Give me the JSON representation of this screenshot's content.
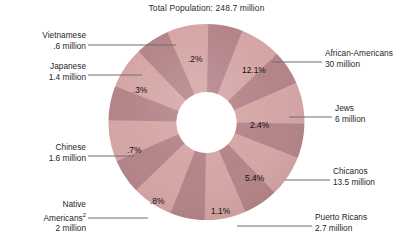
{
  "title": "Total Population: 248.7 million",
  "chart_data": {
    "type": "pie",
    "title": "Total Population: 248.7 million",
    "subtitle": "",
    "xlabel": "",
    "ylabel": "",
    "total_population_millions": 248.7,
    "legend_position": "callout-labels",
    "grid": false,
    "note": "Donut chart of U.S. minority groups; wedges drawn as equal-width textured segments with callout labels giving share of total population.",
    "categories": [
      "African-Americans",
      "Jews",
      "Chicanos",
      "Puerto Ricans",
      "Native Americans",
      "Chinese",
      "Japanese",
      "Vietnamese"
    ],
    "values": [
      12.1,
      2.4,
      5.4,
      1.1,
      0.8,
      0.7,
      0.3,
      0.2
    ],
    "value_unit": "percent of total population",
    "population_millions": [
      30,
      6,
      13.5,
      2.7,
      2,
      1.6,
      1.4,
      0.6
    ],
    "data_labels": [
      "12.1%",
      "2.4%",
      "5.4%",
      "1.1%",
      ".8%",
      ".7%",
      ".3%",
      ".2%"
    ]
  },
  "slices": [
    {
      "id": "african-americans",
      "name": "African-Americans",
      "amount": "30 million",
      "pct": "12.1%"
    },
    {
      "id": "jews",
      "name": "Jews",
      "amount": "6 million",
      "pct": "2.4%"
    },
    {
      "id": "chicanos",
      "name": "Chicanos",
      "amount": "13.5 million",
      "pct": "5.4%"
    },
    {
      "id": "puerto-ricans",
      "name": "Puerto Ricans",
      "amount": "2.7 million",
      "pct": "1.1%"
    },
    {
      "id": "native-americans",
      "name": "Native",
      "name2": "Americans",
      "footnote": "2",
      "amount": "2 million",
      "pct": ".8%"
    },
    {
      "id": "chinese",
      "name": "Chinese",
      "amount": "1.6 million",
      "pct": ".7%"
    },
    {
      "id": "japanese",
      "name": "Japanese",
      "amount": "1.4 million",
      "pct": ".3%"
    },
    {
      "id": "vietnamese",
      "name": "Vietnamese",
      "amount": ".6 million",
      "pct": ".2%"
    }
  ],
  "colors": {
    "wedge_light": "#d9a6a6",
    "wedge_dark": "#b58287",
    "gap": "#ffffff",
    "leader_line": "#6e6e6e",
    "text": "#1f1f1f",
    "background": "#ffffff"
  }
}
